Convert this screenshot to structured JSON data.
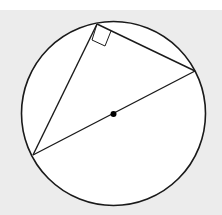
{
  "diagram": {
    "colors": {
      "background": "#ececec",
      "top_strip": "#ffffff",
      "circle_fill": "#ffffff",
      "stroke": "#1a1a1a"
    },
    "circle": {
      "cx": 113.5,
      "cy": 113.5,
      "r": 92
    },
    "center_point": {
      "x": 113.5,
      "y": 114,
      "r": 3
    },
    "vertices": {
      "top": {
        "x": 97,
        "y": 24
      },
      "right": {
        "x": 195,
        "y": 71
      },
      "left": {
        "x": 33,
        "y": 155
      }
    },
    "right_angle_marker": {
      "points": "97,24 92,40 105,46 111,31"
    },
    "labels": []
  }
}
